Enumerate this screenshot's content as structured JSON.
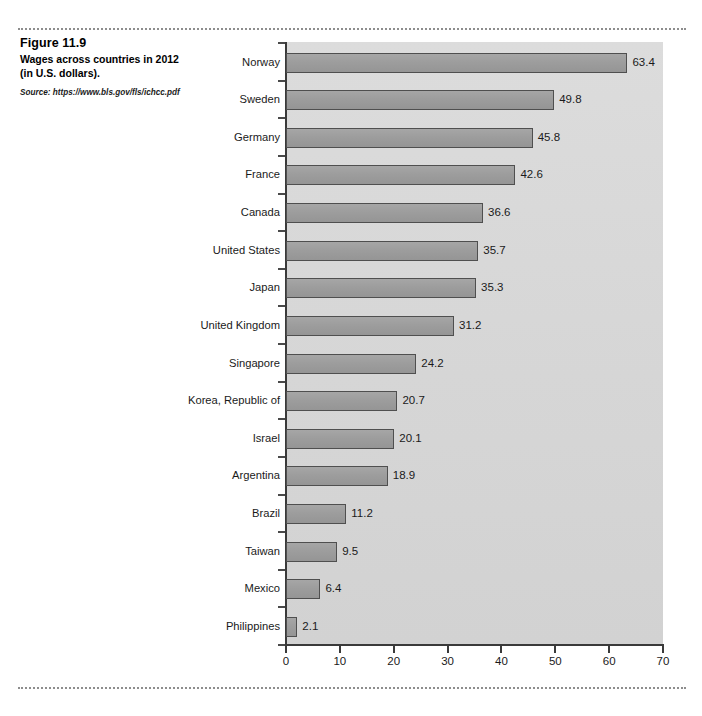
{
  "page": {
    "running_head": "",
    "figure_number": "Figure 11.9",
    "figure_title": "Wages across countries in 2012 (in U.S. dollars).",
    "figure_title_line1": "Wages across countries in 2012",
    "figure_title_line2": "(in U.S. dollars).",
    "source": "Source: https://www.bls.gov/fls/ichcc.pdf"
  },
  "chart_data": {
    "type": "bar",
    "orientation": "horizontal",
    "title": "Wages across countries in 2012 (in U.S. dollars).",
    "xlabel": "",
    "ylabel": "",
    "xlim": [
      0,
      70
    ],
    "xticks": [
      0,
      10,
      20,
      30,
      40,
      50,
      60,
      70
    ],
    "grid": false,
    "legend": null,
    "value_labels": true,
    "categories": [
      "Norway",
      "Sweden",
      "Germany",
      "France",
      "Canada",
      "United States",
      "Japan",
      "United Kingdom",
      "Singapore",
      "Korea, Republic of",
      "Israel",
      "Argentina",
      "Brazil",
      "Taiwan",
      "Mexico",
      "Philippines"
    ],
    "values": [
      63.4,
      49.8,
      45.8,
      42.6,
      36.6,
      35.7,
      35.3,
      31.2,
      24.2,
      20.7,
      20.1,
      18.9,
      11.2,
      9.5,
      6.4,
      2.1
    ],
    "value_label_texts": [
      "63.4",
      "49.8",
      "45.8",
      "42.6",
      "36.6",
      "35.7",
      "35.3",
      "31.2",
      "24.2",
      "20.7",
      "20.1",
      "18.9",
      "11.2",
      "9.5",
      "6.4",
      "2.1"
    ],
    "colors": {
      "bar_fill": "#9d9d9d",
      "bar_border": "#4f4f4f",
      "panel_background": "#d6d6d6",
      "axis": "#3a3a3a",
      "text": "#1a1a1a"
    }
  }
}
